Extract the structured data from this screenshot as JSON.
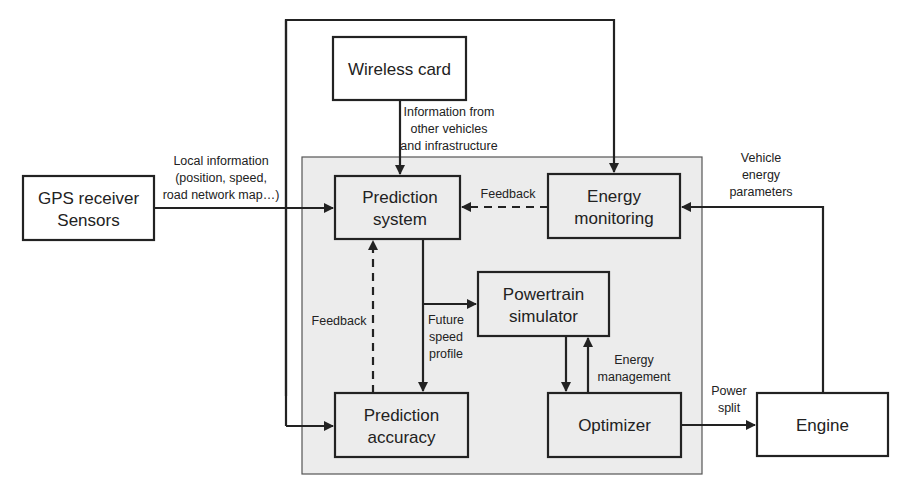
{
  "diagram": {
    "nodes": {
      "wireless_card": {
        "line1": "Wireless card"
      },
      "gps": {
        "line1": "GPS receiver",
        "line2": "Sensors"
      },
      "prediction_system": {
        "line1": "Prediction",
        "line2": "system"
      },
      "energy_monitoring": {
        "line1": "Energy",
        "line2": "monitoring"
      },
      "powertrain_simulator": {
        "line1": "Powertrain",
        "line2": "simulator"
      },
      "prediction_accuracy": {
        "line1": "Prediction",
        "line2": "accuracy"
      },
      "optimizer": {
        "line1": "Optimizer"
      },
      "engine": {
        "line1": "Engine"
      }
    },
    "edge_labels": {
      "info_other": [
        "Information from",
        "other vehicles",
        "and infrastructure"
      ],
      "local_info": [
        "Local information",
        "(position, speed,",
        "road network map…)"
      ],
      "feedback_energy": [
        "Feedback"
      ],
      "vehicle_energy": [
        "Vehicle",
        "energy",
        "parameters"
      ],
      "feedback_accuracy": [
        "Feedback"
      ],
      "future_speed": [
        "Future",
        "speed",
        "profile"
      ],
      "energy_management": [
        "Energy",
        "management"
      ],
      "power_split": [
        "Power",
        "split"
      ]
    }
  }
}
